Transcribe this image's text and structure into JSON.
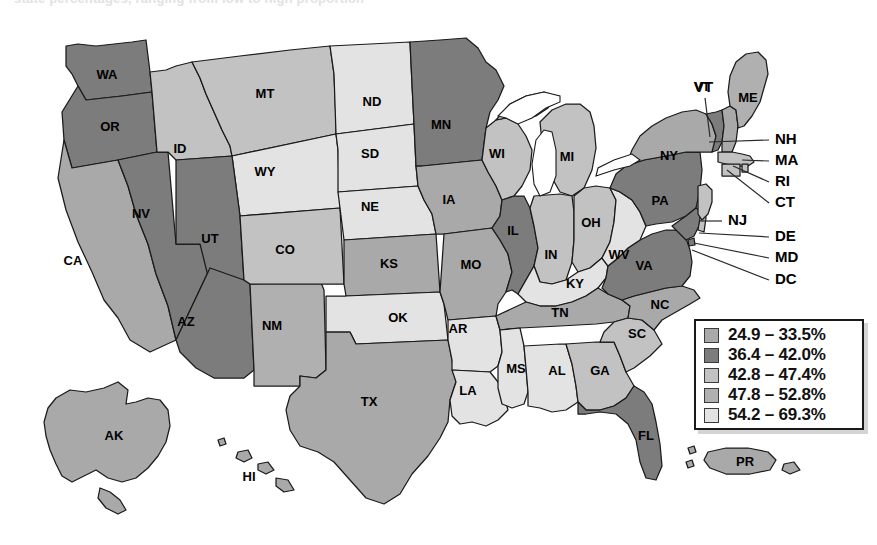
{
  "caption_clipped": "state percentages, ranging from low to high proportion",
  "legend": {
    "name": "map-legend",
    "entries": [
      {
        "swatch": "s1",
        "label": "24.9 – 33.5%",
        "color": "#a9a9a9"
      },
      {
        "swatch": "s2",
        "label": "36.4 – 42.0%",
        "color": "#7c7c7c"
      },
      {
        "swatch": "s3",
        "label": "42.8 – 47.4%",
        "color": "#c2c2c2"
      },
      {
        "swatch": "s4",
        "label": "47.8 – 52.8%",
        "color": "#b0b0b0"
      },
      {
        "swatch": "s5",
        "label": "54.2 – 69.3%",
        "color": "#e3e3e3"
      }
    ]
  },
  "chart_data": {
    "type": "map",
    "title": "",
    "subtype": "choropleth-us-states",
    "legend_position": "bottom-right",
    "bins": [
      {
        "range": "24.9 – 33.5%",
        "min": 24.9,
        "max": 33.5,
        "color": "#a9a9a9",
        "class": "c1"
      },
      {
        "range": "36.4 – 42.0%",
        "min": 36.4,
        "max": 42.0,
        "color": "#7c7c7c",
        "class": "c2"
      },
      {
        "range": "42.8 – 47.4%",
        "min": 42.8,
        "max": 47.4,
        "color": "#c2c2c2",
        "class": "c3"
      },
      {
        "range": "47.8 – 52.8%",
        "min": 47.8,
        "max": 52.8,
        "color": "#b0b0b0",
        "class": "c4"
      },
      {
        "range": "54.2 – 69.3%",
        "min": 54.2,
        "max": 69.3,
        "color": "#e3e3e3",
        "class": "c5"
      }
    ],
    "regions": [
      {
        "code": "WA",
        "bin": 2
      },
      {
        "code": "OR",
        "bin": 2
      },
      {
        "code": "CA",
        "bin": 1
      },
      {
        "code": "NV",
        "bin": 2
      },
      {
        "code": "ID",
        "bin": 3
      },
      {
        "code": "MT",
        "bin": 3
      },
      {
        "code": "WY",
        "bin": 5
      },
      {
        "code": "UT",
        "bin": 2
      },
      {
        "code": "AZ",
        "bin": 2
      },
      {
        "code": "NM",
        "bin": 4
      },
      {
        "code": "CO",
        "bin": 3
      },
      {
        "code": "ND",
        "bin": 5
      },
      {
        "code": "SD",
        "bin": 5
      },
      {
        "code": "NE",
        "bin": 5
      },
      {
        "code": "KS",
        "bin": 1
      },
      {
        "code": "OK",
        "bin": 5
      },
      {
        "code": "TX",
        "bin": 1
      },
      {
        "code": "MN",
        "bin": 2
      },
      {
        "code": "IA",
        "bin": 1
      },
      {
        "code": "MO",
        "bin": 1
      },
      {
        "code": "AR",
        "bin": 5
      },
      {
        "code": "LA",
        "bin": 5
      },
      {
        "code": "WI",
        "bin": 3
      },
      {
        "code": "IL",
        "bin": 2
      },
      {
        "code": "MI",
        "bin": 3
      },
      {
        "code": "IN",
        "bin": 3
      },
      {
        "code": "OH",
        "bin": 3
      },
      {
        "code": "KY",
        "bin": 5
      },
      {
        "code": "TN",
        "bin": 1
      },
      {
        "code": "MS",
        "bin": 5
      },
      {
        "code": "AL",
        "bin": 5
      },
      {
        "code": "GA",
        "bin": 3
      },
      {
        "code": "FL",
        "bin": 2
      },
      {
        "code": "SC",
        "bin": 3
      },
      {
        "code": "NC",
        "bin": 1
      },
      {
        "code": "VA",
        "bin": 2
      },
      {
        "code": "WV",
        "bin": 5
      },
      {
        "code": "MD",
        "bin": 2
      },
      {
        "code": "DE",
        "bin": 3
      },
      {
        "code": "DC",
        "bin": 2
      },
      {
        "code": "PA",
        "bin": 2
      },
      {
        "code": "NJ",
        "bin": 3
      },
      {
        "code": "NY",
        "bin": 1
      },
      {
        "code": "CT",
        "bin": 3
      },
      {
        "code": "RI",
        "bin": 3
      },
      {
        "code": "MA",
        "bin": 3
      },
      {
        "code": "VT",
        "bin": 2
      },
      {
        "code": "NH",
        "bin": 1
      },
      {
        "code": "ME",
        "bin": 4
      },
      {
        "code": "AK",
        "bin": 1
      },
      {
        "code": "HI",
        "bin": 1
      },
      {
        "code": "PR",
        "bin": 1
      }
    ]
  },
  "map": {
    "name": "us-choropleth-map",
    "inline_labels": [
      {
        "code": "WA",
        "x": 107,
        "y": 76
      },
      {
        "code": "OR",
        "x": 110,
        "y": 128
      },
      {
        "code": "CA",
        "x": 73,
        "y": 262
      },
      {
        "code": "NV",
        "x": 141,
        "y": 215
      },
      {
        "code": "ID",
        "x": 180,
        "y": 150
      },
      {
        "code": "MT",
        "x": 265,
        "y": 95
      },
      {
        "code": "WY",
        "x": 265,
        "y": 173
      },
      {
        "code": "UT",
        "x": 210,
        "y": 240
      },
      {
        "code": "AZ",
        "x": 186,
        "y": 323
      },
      {
        "code": "NM",
        "x": 272,
        "y": 327
      },
      {
        "code": "CO",
        "x": 285,
        "y": 251
      },
      {
        "code": "ND",
        "x": 372,
        "y": 103
      },
      {
        "code": "SD",
        "x": 370,
        "y": 155
      },
      {
        "code": "NE",
        "x": 370,
        "y": 208
      },
      {
        "code": "KS",
        "x": 389,
        "y": 265
      },
      {
        "code": "OK",
        "x": 398,
        "y": 319
      },
      {
        "code": "TX",
        "x": 369,
        "y": 403
      },
      {
        "code": "MN",
        "x": 441,
        "y": 126
      },
      {
        "code": "IA",
        "x": 449,
        "y": 201
      },
      {
        "code": "MO",
        "x": 471,
        "y": 266
      },
      {
        "code": "AR",
        "x": 458,
        "y": 330
      },
      {
        "code": "LA",
        "x": 468,
        "y": 392
      },
      {
        "code": "WI",
        "x": 497,
        "y": 155
      },
      {
        "code": "IL",
        "x": 513,
        "y": 232
      },
      {
        "code": "MI",
        "x": 567,
        "y": 158
      },
      {
        "code": "IN",
        "x": 551,
        "y": 256
      },
      {
        "code": "OH",
        "x": 591,
        "y": 224
      },
      {
        "code": "KY",
        "x": 575,
        "y": 285
      },
      {
        "code": "TN",
        "x": 560,
        "y": 314
      },
      {
        "code": "MS",
        "x": 516,
        "y": 370
      },
      {
        "code": "AL",
        "x": 557,
        "y": 372
      },
      {
        "code": "GA",
        "x": 600,
        "y": 372
      },
      {
        "code": "FL",
        "x": 646,
        "y": 437
      },
      {
        "code": "SC",
        "x": 637,
        "y": 335
      },
      {
        "code": "NC",
        "x": 660,
        "y": 306
      },
      {
        "code": "VA",
        "x": 644,
        "y": 267
      },
      {
        "code": "WV",
        "x": 619,
        "y": 256
      },
      {
        "code": "PA",
        "x": 660,
        "y": 202
      },
      {
        "code": "NY",
        "x": 669,
        "y": 157
      },
      {
        "code": "VT",
        "x": 702,
        "y": 88
      },
      {
        "code": "ME",
        "x": 748,
        "y": 99
      },
      {
        "code": "AK",
        "x": 114,
        "y": 437
      },
      {
        "code": "HI",
        "x": 249,
        "y": 478
      },
      {
        "code": "PR",
        "x": 745,
        "y": 463
      }
    ],
    "leader_labels": [
      {
        "code": "NH",
        "x": 775,
        "y": 140,
        "lx1": 709,
        "ly1": 142,
        "lx2": 769,
        "ly2": 140
      },
      {
        "code": "MA",
        "x": 775,
        "y": 161,
        "lx1": 742,
        "ly1": 160,
        "lx2": 769,
        "ly2": 161
      },
      {
        "code": "RI",
        "x": 775,
        "y": 182,
        "lx1": 733,
        "ly1": 166,
        "lx2": 769,
        "ly2": 182
      },
      {
        "code": "CT",
        "x": 775,
        "y": 203,
        "lx1": 727,
        "ly1": 170,
        "lx2": 769,
        "ly2": 203
      },
      {
        "code": "NJ",
        "x": 728,
        "y": 221,
        "lx1": 700,
        "ly1": 221,
        "lx2": 722,
        "ly2": 221
      },
      {
        "code": "DE",
        "x": 775,
        "y": 237,
        "lx1": 699,
        "ly1": 233,
        "lx2": 769,
        "ly2": 237
      },
      {
        "code": "MD",
        "x": 775,
        "y": 258,
        "lx1": 694,
        "ly1": 243,
        "lx2": 769,
        "ly2": 258
      },
      {
        "code": "DC",
        "x": 775,
        "y": 280,
        "lx1": 692,
        "ly1": 250,
        "lx2": 769,
        "ly2": 280
      },
      {
        "code": "VT",
        "x": 694,
        "y": 88,
        "lx1": 705,
        "ly1": 98,
        "lx2": 710,
        "ly2": 137
      }
    ]
  }
}
